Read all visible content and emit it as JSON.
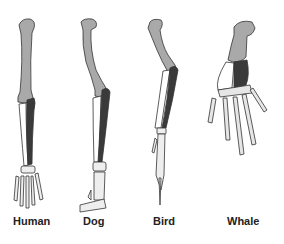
{
  "figure": {
    "colors": {
      "humerus": "#a9a9a9",
      "radius": "#ffffff",
      "ulna": "#3a3a3a",
      "hand": "#e6e6e6",
      "outline": "#333333"
    },
    "limbs": [
      {
        "id": "human",
        "label": "Human"
      },
      {
        "id": "dog",
        "label": "Dog"
      },
      {
        "id": "bird",
        "label": "Bird"
      },
      {
        "id": "whale",
        "label": "Whale"
      }
    ]
  }
}
